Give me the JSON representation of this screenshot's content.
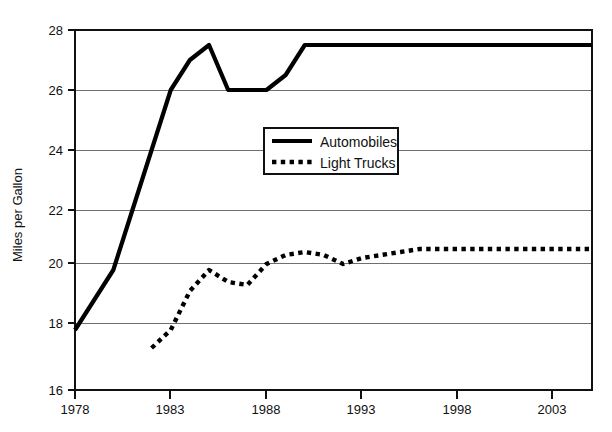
{
  "chart_data": {
    "type": "line",
    "title": "",
    "xlabel": "",
    "ylabel": "Miles per Gallon",
    "xlim": [
      1978,
      2005
    ],
    "ylim": [
      16,
      28
    ],
    "grid": true,
    "legend_position": "upper-center",
    "x_ticks": [
      "1978",
      "1983",
      "1988",
      "1993",
      "1998",
      "2003"
    ],
    "y_ticks": [
      "16",
      "18",
      "20",
      "22",
      "24",
      "26",
      "28"
    ],
    "series": [
      {
        "name": "Automobiles",
        "style": "solid",
        "color": "#000000",
        "x": [
          1978,
          1979,
          1980,
          1981,
          1982,
          1983,
          1984,
          1985,
          1986,
          1987,
          1988,
          1989,
          1990,
          1991,
          1992,
          1993,
          1994,
          1995,
          1996,
          1997,
          1998,
          1999,
          2000,
          2001,
          2002,
          2003,
          2004,
          2005
        ],
        "values": [
          18.0,
          19.0,
          20.0,
          22.0,
          24.0,
          26.0,
          27.0,
          27.5,
          26.0,
          26.0,
          26.0,
          26.5,
          27.5,
          27.5,
          27.5,
          27.5,
          27.5,
          27.5,
          27.5,
          27.5,
          27.5,
          27.5,
          27.5,
          27.5,
          27.5,
          27.5,
          27.5,
          27.5
        ]
      },
      {
        "name": "Light Trucks",
        "style": "dotted",
        "color": "#000000",
        "x": [
          1982,
          1983,
          1984,
          1985,
          1986,
          1987,
          1988,
          1989,
          1990,
          1991,
          1992,
          1993,
          1994,
          1995,
          1996,
          1997,
          1998,
          1999,
          2000,
          2001,
          2002,
          2003,
          2004,
          2005
        ],
        "values": [
          17.4,
          18.0,
          19.3,
          20.0,
          19.6,
          19.5,
          20.2,
          20.5,
          20.6,
          20.5,
          20.2,
          20.4,
          20.5,
          20.6,
          20.7,
          20.7,
          20.7,
          20.7,
          20.7,
          20.7,
          20.7,
          20.7,
          20.7,
          20.7
        ]
      }
    ]
  },
  "legend": {
    "items": [
      {
        "label": "Automobiles",
        "style": "solid"
      },
      {
        "label": "Light Trucks",
        "style": "dotted"
      }
    ]
  },
  "axes": {
    "y_title": "Miles per Gallon",
    "y_tick_labels": [
      "28",
      "26",
      "24",
      "22",
      "20",
      "18",
      "16"
    ],
    "x_tick_labels": [
      "1978",
      "1983",
      "1988",
      "1993",
      "1998",
      "2003"
    ]
  }
}
